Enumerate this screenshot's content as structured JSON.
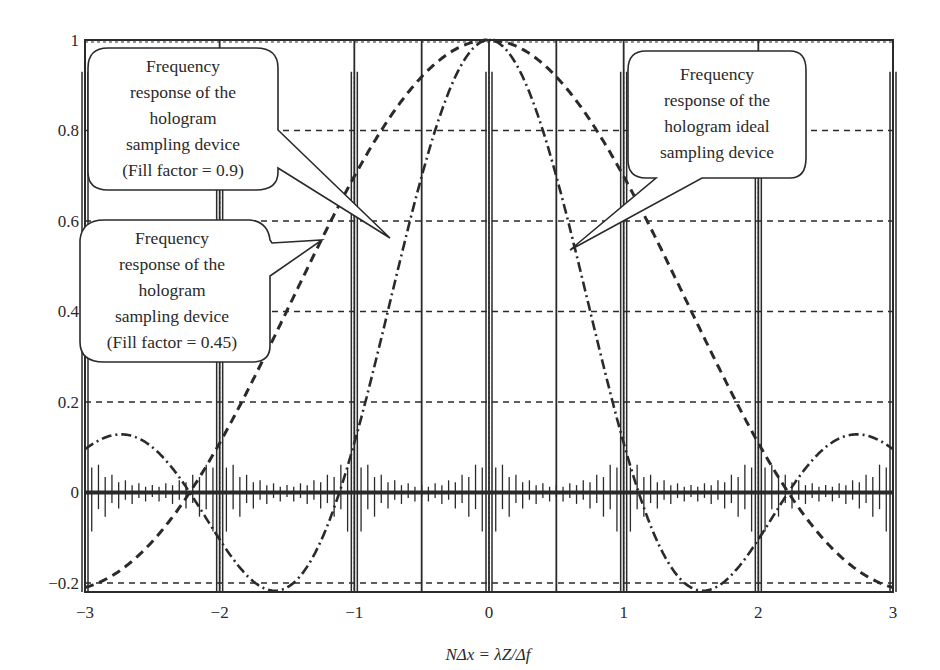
{
  "chart_data": {
    "type": "line",
    "title": "",
    "xlabel": "NΔx = λZ/Δf",
    "ylabel": "",
    "xlim": [
      -3,
      3
    ],
    "ylim": [
      -0.22,
      1.0
    ],
    "x_ticks": [
      -3,
      -2,
      -1,
      0,
      1,
      2,
      3
    ],
    "x_tick_labels": [
      "−3",
      "−2",
      "−1",
      "0",
      "1",
      "2",
      "3"
    ],
    "y_ticks": [
      -0.2,
      0,
      0.2,
      0.4,
      0.6,
      0.8,
      1
    ],
    "y_tick_labels": [
      "−0.2",
      "0",
      "0.2",
      "0.4",
      "0.6",
      "0.8",
      "1"
    ],
    "grid": "horizontal dashed at y ticks",
    "series": [
      {
        "name": "Frequency response of the hologram sampling device (Fill factor = 0.45)",
        "style": "dashed",
        "function": "sinc(0.45·x)",
        "x": [
          -3,
          -2.5,
          -2,
          -1.5,
          -1,
          -0.5,
          0,
          0.5,
          1,
          1.5,
          2,
          2.5,
          3
        ],
        "values": [
          -0.21,
          -0.08,
          0.08,
          0.38,
          0.7,
          0.92,
          1.0,
          0.92,
          0.7,
          0.38,
          0.08,
          -0.08,
          -0.21
        ]
      },
      {
        "name": "Frequency response of the hologram sampling device (Fill factor = 0.9)",
        "style": "dash-dot",
        "function": "sinc(0.9·x)",
        "x": [
          -3,
          -2.7,
          -2.5,
          -2,
          -1.6,
          -1.1,
          -1,
          -0.5,
          0,
          0.5,
          1,
          1.1,
          1.6,
          2,
          2.5,
          2.7,
          3
        ],
        "values": [
          0.1,
          0.13,
          0.12,
          -0.03,
          -0.22,
          0.0,
          0.11,
          0.75,
          1.0,
          0.75,
          0.11,
          0.0,
          -0.22,
          -0.03,
          0.12,
          0.13,
          0.1
        ]
      },
      {
        "name": "Frequency response of the hologram ideal sampling device",
        "style": "solid impulses",
        "impulse_positions": [
          -2,
          -1,
          0,
          1,
          2,
          3
        ],
        "impulse_height": 1.0,
        "note": "impulse train at integer positions with oscillating side-lobe ripples near 0"
      }
    ],
    "vertical_lines": [
      -2,
      -1,
      -0.5,
      0,
      0.5,
      1,
      2,
      3
    ],
    "annotations": [
      {
        "text": [
          "Frequency",
          "response of the",
          "hologram",
          "sampling device",
          "(Fill factor = 0.9)"
        ],
        "points_to": "dash-dot curve near x=-0.7, y=0.55"
      },
      {
        "text": [
          "Frequency",
          "response of the",
          "hologram",
          "sampling device",
          "(Fill factor = 0.45)"
        ],
        "points_to": "dashed curve near x=-1.2, y=0.56"
      },
      {
        "text": [
          "Frequency",
          "response of the",
          "hologram ideal",
          "sampling device"
        ],
        "points_to": "impulse near x=0.45, y=0.55"
      }
    ]
  },
  "labels": {
    "xlabel": "NΔx = λZ/Δf",
    "xticks": [
      "−3",
      "−2",
      "−1",
      "0",
      "1",
      "2",
      "3"
    ],
    "yticks": [
      "−0.2",
      "0",
      "0.2",
      "0.4",
      "0.6",
      "0.8",
      "1"
    ],
    "callout_09": [
      "Frequency",
      "response of the",
      "hologram",
      "sampling device",
      "(Fill factor = 0.9)"
    ],
    "callout_045": [
      "Frequency",
      "response of the",
      "hologram",
      "sampling device",
      "(Fill factor = 0.45)"
    ],
    "callout_ideal": [
      "Frequency",
      "response of the",
      "hologram ideal",
      "sampling device"
    ]
  }
}
